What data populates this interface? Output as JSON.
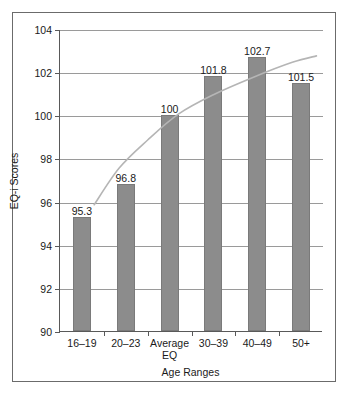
{
  "chart_data": {
    "type": "bar",
    "title": "",
    "subtitle": "",
    "categories": [
      "16–19",
      "20–23",
      "Average\nEQ",
      "30–39",
      "40–49",
      "50+"
    ],
    "category_lines": [
      [
        "16–19"
      ],
      [
        "20–23"
      ],
      [
        "Average",
        "EQ"
      ],
      [
        "30–39"
      ],
      [
        "40–49"
      ],
      [
        "50+"
      ]
    ],
    "values": [
      95.3,
      96.8,
      100,
      101.8,
      102.7,
      101.5
    ],
    "value_labels": [
      "95.3",
      "96.8",
      "100",
      "101.8",
      "102.7",
      "101.5"
    ],
    "xlabel": "Age Ranges",
    "ylabel": "EQ-i Scores",
    "ylim": [
      90,
      104
    ],
    "yticks": [
      90,
      92,
      94,
      96,
      98,
      100,
      102,
      104
    ],
    "ytick_labels": [
      "90",
      "92",
      "94",
      "96",
      "98",
      "100",
      "102",
      "104"
    ],
    "grid": true,
    "grid_axis": "y",
    "legend": false,
    "legend_position": "none",
    "series": [
      {
        "name": "EQ-i Scores",
        "type": "bar",
        "values": [
          95.3,
          96.8,
          100,
          101.8,
          102.7,
          101.5
        ],
        "color": "#8c8c8c"
      },
      {
        "name": "trend",
        "type": "line",
        "smooth": true,
        "color": "#b5b5b5",
        "points": [
          [
            0.28,
            95.9
          ],
          [
            0.85,
            97.6
          ],
          [
            1.5,
            98.9
          ],
          [
            2.2,
            100.1
          ],
          [
            3.0,
            101.0
          ],
          [
            3.9,
            101.8
          ],
          [
            4.8,
            102.5
          ],
          [
            5.35,
            102.8
          ]
        ]
      }
    ],
    "colors": {
      "bar_fill": "#8c8c8c",
      "bar_edge": "#7a7a7a",
      "gridline": "#9a9a9a",
      "axis": "#595959",
      "trend_line": "#b5b5b5",
      "frame": "#6b6b6b",
      "text": "#1a1a1a",
      "background": "#ffffff"
    }
  }
}
